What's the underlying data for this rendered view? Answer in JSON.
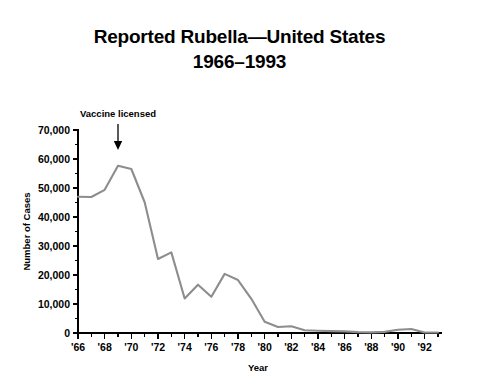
{
  "chart_data": {
    "type": "line",
    "title": "Reported Rubella—United States",
    "subtitle": "1966–1993",
    "xlabel": "Year",
    "ylabel": "Number of Cases",
    "xlim": [
      1966,
      1993
    ],
    "ylim": [
      0,
      70000
    ],
    "grid": false,
    "legend": "none",
    "line_color": "#8d8d8d",
    "x_tick_labels": [
      "'66",
      "'68",
      "'70",
      "'72",
      "'74",
      "'76",
      "'78",
      "'80",
      "'82",
      "'84",
      "'86",
      "'88",
      "'90",
      "'92"
    ],
    "x_tick_values": [
      1966,
      1968,
      1970,
      1972,
      1974,
      1976,
      1978,
      1980,
      1982,
      1984,
      1986,
      1988,
      1990,
      1992
    ],
    "x_minor_tick_values": [
      1967,
      1969,
      1971,
      1973,
      1975,
      1977,
      1979,
      1981,
      1983,
      1985,
      1987,
      1989,
      1991,
      1993
    ],
    "y_tick_labels": [
      "0",
      "10,000",
      "20,000",
      "30,000",
      "40,000",
      "50,000",
      "60,000",
      "70,000"
    ],
    "y_tick_values": [
      0,
      10000,
      20000,
      30000,
      40000,
      50000,
      60000,
      70000
    ],
    "annotations": [
      {
        "text": "Vaccine licensed",
        "x": 1969,
        "y": 70000,
        "arrow": "down"
      }
    ],
    "x": [
      1966,
      1967,
      1968,
      1969,
      1970,
      1971,
      1972,
      1973,
      1974,
      1975,
      1976,
      1977,
      1978,
      1979,
      1980,
      1981,
      1982,
      1983,
      1984,
      1985,
      1986,
      1987,
      1988,
      1989,
      1990,
      1991,
      1992,
      1993
    ],
    "values": [
      46975,
      46888,
      49371,
      57686,
      56552,
      45086,
      25507,
      27804,
      11917,
      16652,
      12491,
      20395,
      18269,
      11795,
      3904,
      2077,
      2325,
      970,
      752,
      630,
      551,
      306,
      225,
      396,
      1125,
      1401,
      160,
      192
    ],
    "series": [
      {
        "name": "Reported rubella cases",
        "values": [
          46975,
          46888,
          49371,
          57686,
          56552,
          45086,
          25507,
          27804,
          11917,
          16652,
          12491,
          20395,
          18269,
          11795,
          3904,
          2077,
          2325,
          970,
          752,
          630,
          551,
          306,
          225,
          396,
          1125,
          1401,
          160,
          192
        ]
      }
    ]
  },
  "figure": {
    "title_line1": "Reported Rubella—United States",
    "title_line2": "1966–1993",
    "y_axis_title": "Number of Cases",
    "x_axis_title": "Year",
    "annotation_label": "Vaccine licensed"
  }
}
